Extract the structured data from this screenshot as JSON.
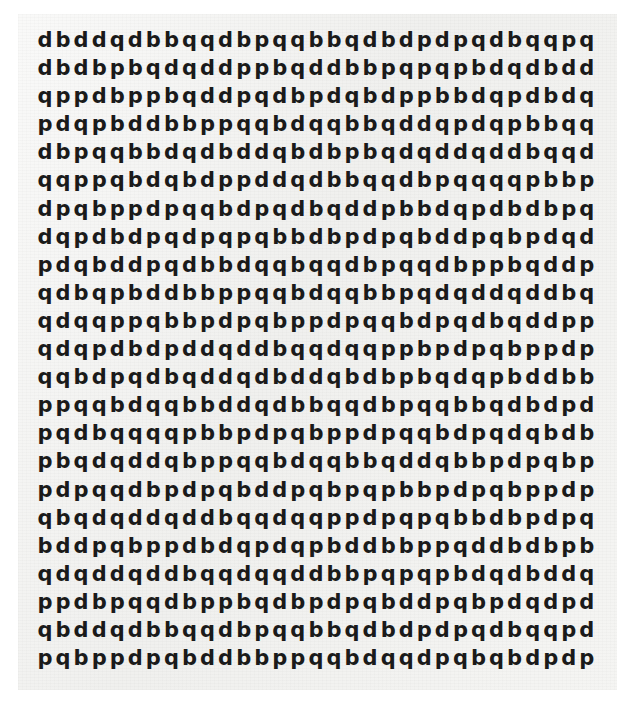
{
  "page": {
    "type": "letter-grid-worksheet",
    "background_color": "#ffffff",
    "paper_color": "#f2f2f0",
    "text_color": "#1a1a1a",
    "alphabet": [
      "b",
      "d",
      "p",
      "q"
    ],
    "rows_count": 23,
    "columns_count": 31
  },
  "grid": {
    "rows": [
      "d b d d q d b b q q d b p q q b b q d b d p d p q d b q q p q",
      "d b d b p b q d q d d p p b q d d b b p q p q p b d q d b d d",
      "q p p d b p p b q d d p q d b p d q b d p p b b d q p d b d q",
      "p d q p b d d b b p p q q b d q q b b q d d q p d q p b b q q",
      "d b p q q b b d q d b d d q b d b p b q d q d d q d d b q q d",
      "q q p p q b d q b d p p d d q d b b q q d b p q q q q p b b p",
      "d p q b p p d p q q b d p q d b q d d p b b d q p d b d b p q",
      "d q p d b d p q d p q p q b b d b p d p q b d d p q b p d q d",
      "p d q b d d p q d b b d q q b q q d b p q q d b p p b q d d p",
      "q d b q p b d d b b p p q q b d q q b b p q d q d d q d d b q",
      "q d q q p p q b b p d p q b p p d p q q b d p q d b q d d p p",
      "q d q p d b d p d d q d d b q q d q q p p b p d p q b p p d p",
      "q q b d p q d b q d d q d b d d q b d b p b q d q p b d d b b",
      "p p q q b d q q b b d d q d b b q q d b p q q b b q d b d p d",
      "p q d b q q q q p b b p d p q b p p d p q q b d p q d q b d b",
      "p b q d q d d q b p p q q b d q q b b q d d q b b p d p q b p",
      "p d p q q d b p d p q b d d p q b p q p b b p d p q b p p d p",
      "q b q d q d d q d d b q q d q q p p d p q p q b b d b p d p q",
      "b d d p q b p p d b d q p d q p b d d b b p p q d d b d b p b",
      "q d q d d q d d b q q d q q d d b b p q p q p b d q d b d d q",
      "p p d b p q q d b p p b q d b p d p q b d d p q b p d q d p d",
      "q b d d q d b b q q d b p q q b b q d b d p d p q d b q q p d",
      "p q b p p d p q b d d b b p p q q b d q q d p q b q b d p d p"
    ]
  }
}
